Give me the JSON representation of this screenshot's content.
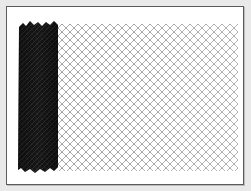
{
  "image": {
    "subject": "chain-link fence roll",
    "description": "Partially unrolled chain-link fence mesh on white background with thin dark border",
    "colors": {
      "background": "#e9e9e9",
      "frame_border": "#5a5a5a",
      "frame_fill": "#ffffff",
      "roll": "#111111",
      "mesh_wire": "#8a8a8a"
    },
    "mesh": {
      "pitch_px": 8,
      "columns": 22,
      "rows": 18
    }
  }
}
